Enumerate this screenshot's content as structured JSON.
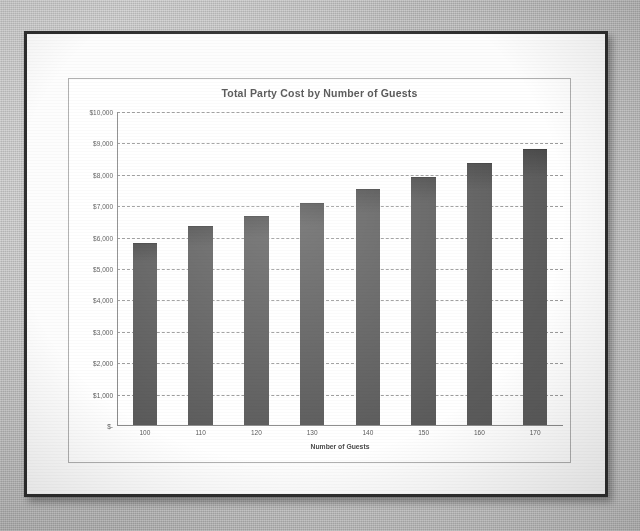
{
  "document": {
    "kind": "scanned-photo-of-printed-chart",
    "paper_color": "#fdfdfd",
    "backdrop_color": "#bdbdbd",
    "border_color": "#2e2e2e"
  },
  "chart_data": {
    "type": "bar",
    "title": "Total Party Cost by Number of Guests",
    "xlabel": "Number of Guests",
    "ylabel": "",
    "categories": [
      "100",
      "110",
      "120",
      "130",
      "140",
      "150",
      "160",
      "170"
    ],
    "values": [
      5830,
      6370,
      6690,
      7100,
      7550,
      7920,
      8390,
      8820
    ],
    "ylim": [
      0,
      10000
    ],
    "ytick_values": [
      10000,
      9000,
      8000,
      7000,
      6000,
      5000,
      4000,
      3000,
      2000,
      1000,
      0
    ],
    "ytick_labels": [
      "$10,000",
      "$9,000",
      "$8,000",
      "$7,000",
      "$6,000",
      "$5,000",
      "$4,000",
      "$3,000",
      "$2,000",
      "$1,000",
      "$-"
    ],
    "grid": true,
    "gridline_style": "dashed",
    "legend": false,
    "bar_color": "#5b5b5b",
    "plot_background": "#ffffff"
  }
}
